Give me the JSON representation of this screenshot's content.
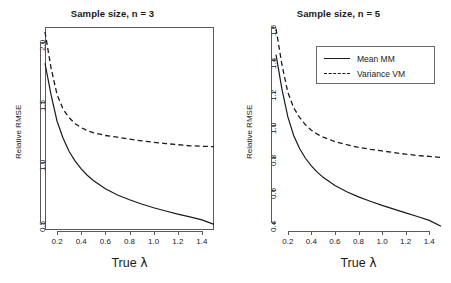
{
  "figure": {
    "type": "multi-panel-line-chart",
    "panel_count": 2,
    "background": "#ffffff",
    "line_color": "#1a1a1a",
    "frame_color": "#5a5a5a"
  },
  "legend": {
    "position": "top-right of right panel",
    "entries": [
      {
        "label": "Mean MM",
        "style": "solid"
      },
      {
        "label": "Variance VM",
        "style": "dashed"
      }
    ]
  },
  "chart_data": [
    {
      "type": "line",
      "panel": "left",
      "title": "Sample size, n = 3",
      "xlabel": "True λ",
      "ylabel": "Relative RMSE",
      "xlim": [
        0.1,
        1.5
      ],
      "ylim": [
        0.44,
        2.12
      ],
      "xticks": [
        0.2,
        0.4,
        0.6,
        0.8,
        1.0,
        1.2,
        1.4
      ],
      "xtick_labels": [
        "0.2",
        "0.4",
        "0.6",
        "0.8",
        "1.0",
        "1.2",
        "1.4"
      ],
      "yticks": [
        0.5,
        1.0,
        1.5,
        2.0
      ],
      "ytick_labels": [
        "0.5",
        "1.0",
        "1.5",
        "2.0"
      ],
      "grid": false,
      "x": [
        0.1,
        0.15,
        0.2,
        0.25,
        0.3,
        0.35,
        0.4,
        0.45,
        0.5,
        0.6,
        0.7,
        0.8,
        0.9,
        1.0,
        1.1,
        1.2,
        1.3,
        1.4,
        1.5
      ],
      "series": [
        {
          "name": "Mean MM",
          "style": "solid",
          "values": [
            1.82,
            1.56,
            1.34,
            1.2,
            1.09,
            1.01,
            0.945,
            0.893,
            0.85,
            0.782,
            0.73,
            0.69,
            0.655,
            0.624,
            0.597,
            0.572,
            0.548,
            0.524,
            0.487
          ]
        },
        {
          "name": "Variance VM",
          "style": "dashed",
          "values": [
            2.08,
            1.78,
            1.56,
            1.44,
            1.37,
            1.32,
            1.287,
            1.263,
            1.246,
            1.222,
            1.208,
            1.192,
            1.178,
            1.166,
            1.155,
            1.146,
            1.137,
            1.133,
            1.13
          ]
        }
      ]
    },
    {
      "type": "line",
      "panel": "right",
      "title": "Sample size, n = 5",
      "xlabel": "True λ",
      "ylabel": "Relative RMSE",
      "xlim": [
        0.1,
        1.5
      ],
      "ylim": [
        0.355,
        1.6
      ],
      "xticks": [
        0.2,
        0.4,
        0.6,
        0.8,
        1.0,
        1.2,
        1.4
      ],
      "xtick_labels": [
        "0.2",
        "0.4",
        "0.6",
        "0.8",
        "1.0",
        "1.2",
        "1.4"
      ],
      "yticks": [
        0.4,
        0.6,
        0.8,
        1.0,
        1.2,
        1.4,
        1.6
      ],
      "ytick_labels": [
        "0.4",
        "0.6",
        "0.8",
        "1.0",
        "1.2",
        "1.4",
        "1.6"
      ],
      "grid": false,
      "x": [
        0.1,
        0.15,
        0.2,
        0.25,
        0.3,
        0.35,
        0.4,
        0.45,
        0.5,
        0.6,
        0.7,
        0.8,
        0.9,
        1.0,
        1.1,
        1.2,
        1.3,
        1.4,
        1.5
      ],
      "series": [
        {
          "name": "Mean MM",
          "style": "solid",
          "values": [
            1.43,
            1.22,
            1.05,
            0.935,
            0.855,
            0.795,
            0.748,
            0.71,
            0.678,
            0.628,
            0.59,
            0.558,
            0.531,
            0.506,
            0.483,
            0.46,
            0.438,
            0.414,
            0.378
          ]
        },
        {
          "name": "Variance VM",
          "style": "dashed",
          "values": [
            1.59,
            1.37,
            1.2,
            1.105,
            1.045,
            1.0,
            0.967,
            0.943,
            0.925,
            0.897,
            0.878,
            0.862,
            0.85,
            0.84,
            0.83,
            0.82,
            0.812,
            0.806,
            0.8
          ]
        }
      ]
    }
  ]
}
